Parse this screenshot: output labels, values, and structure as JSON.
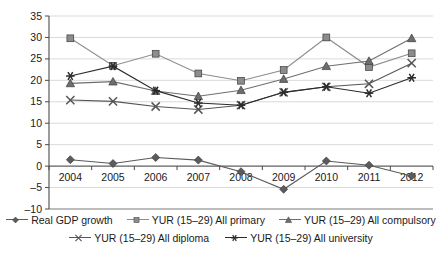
{
  "chart_data": {
    "type": "line",
    "title": "",
    "xlabel": "",
    "ylabel": "",
    "categories": [
      "2004",
      "2005",
      "2006",
      "2007",
      "2008",
      "2009",
      "2010",
      "2011",
      "2012"
    ],
    "ylim": [
      -10,
      35
    ],
    "ytick_step": 5,
    "yticks": [
      "35",
      "30",
      "25",
      "20",
      "15",
      "10",
      "5",
      "0",
      "-5",
      "-10"
    ],
    "grid": "horizontal",
    "legend_position": "bottom",
    "series": [
      {
        "name": "Real GDP growth",
        "marker": "diamond",
        "color": "#5b5b5b",
        "values": [
          1.5,
          0.6,
          2.0,
          1.4,
          -1.3,
          -5.4,
          1.2,
          0.2,
          -2.3
        ]
      },
      {
        "name": "YUR (15–29) All primary",
        "marker": "square",
        "color": "#8c8c8c",
        "values": [
          29.8,
          23.4,
          26.2,
          21.6,
          19.9,
          22.4,
          30.0,
          23.1,
          26.3
        ]
      },
      {
        "name": "YUR (15–29) All compulsory",
        "marker": "triangle",
        "color": "#6e6e6e",
        "values": [
          19.3,
          19.7,
          17.5,
          16.3,
          17.7,
          20.3,
          23.3,
          24.5,
          29.8
        ]
      },
      {
        "name": "YUR (15–29) All diploma",
        "marker": "cross",
        "color": "#555555",
        "values": [
          15.4,
          15.1,
          13.9,
          13.2,
          14.2,
          17.2,
          18.5,
          19.2,
          24.0
        ]
      },
      {
        "name": "YUR (15–29) All university",
        "marker": "asterisk",
        "color": "#2b2b2b",
        "values": [
          21.0,
          23.3,
          17.6,
          14.7,
          14.2,
          17.2,
          18.5,
          17.0,
          20.6
        ]
      }
    ]
  },
  "legend": {
    "row1": [
      {
        "label": "Real GDP growth",
        "marker": "diamond"
      },
      {
        "label": "YUR (15–29) All primary",
        "marker": "square"
      },
      {
        "label": "YUR (15–29) All compulsory",
        "marker": "triangle"
      }
    ],
    "row2": [
      {
        "label": "YUR (15–29) All diploma",
        "marker": "cross"
      },
      {
        "label": "YUR (15–29) All university",
        "marker": "asterisk"
      }
    ]
  }
}
